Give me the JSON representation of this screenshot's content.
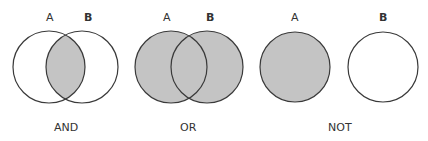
{
  "colors": {
    "fill": "#c4c4c4",
    "stroke": "#3a3a3a",
    "background": "#ffffff",
    "text": "#333333"
  },
  "diagrams": [
    {
      "operator": "AND",
      "set_a_label": "A",
      "set_b_label": "B",
      "shaded": "intersection of A and B"
    },
    {
      "operator": "OR",
      "set_a_label": "A",
      "set_b_label": "B",
      "shaded": "union of A and B"
    },
    {
      "operator": "NOT",
      "set_a_label": "A",
      "set_b_label": "B",
      "shaded": "A only (B excluded)"
    }
  ]
}
